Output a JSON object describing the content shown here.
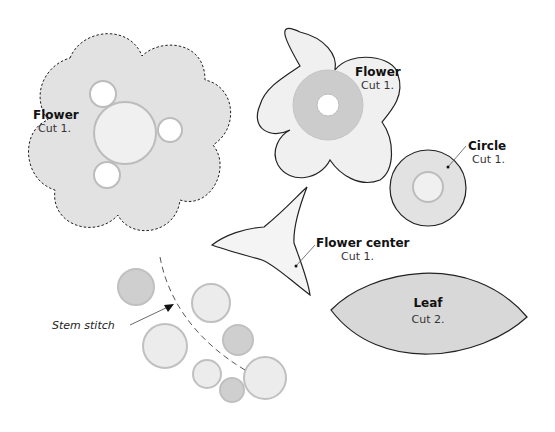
{
  "pieces": {
    "flower_large": {
      "title": "Flower",
      "instruction": "Cut 1."
    },
    "flower_small": {
      "title": "Flower",
      "instruction": "Cut 1."
    },
    "circle": {
      "title": "Circle",
      "instruction": "Cut 1."
    },
    "flower_center": {
      "title": "Flower center",
      "instruction": "Cut 1."
    },
    "leaf": {
      "title": "Leaf",
      "instruction": "Cut 2."
    }
  },
  "annotations": {
    "stem_stitch": "Stem stitch"
  },
  "colors": {
    "outline": "#222222",
    "fill_light": "#f0f0f0",
    "fill_mid": "#e2e2e2",
    "fill_dark": "#cfcfcf",
    "ring_stroke": "#bcbcbc",
    "leaf_fill": "#d8d8d8"
  }
}
